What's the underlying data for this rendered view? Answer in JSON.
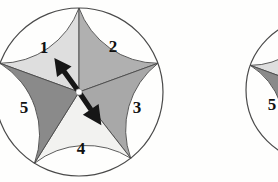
{
  "figure": {
    "background_color": "#fefefd"
  },
  "spinners": [
    {
      "name": "spinner-left",
      "center": {
        "x": 79,
        "y": 92
      },
      "radius": 84,
      "hub": {
        "color": "#ffffff",
        "radius": 3.2
      },
      "outline_color": "#4a4a4a",
      "sectors": [
        {
          "number": "1",
          "label": "1",
          "color": "#dedede",
          "start_angle": 90,
          "end_angle": 160,
          "label_x": 44,
          "label_y": 53
        },
        {
          "number": "2",
          "label": "2",
          "color": "#b0b0b0",
          "start_angle": 20,
          "end_angle": 90,
          "label_x": 113,
          "label_y": 52
        },
        {
          "number": "3",
          "label": "3",
          "color": "#a8a8a8",
          "start_angle": -52,
          "end_angle": 20,
          "label_x": 137,
          "label_y": 113
        },
        {
          "number": "4",
          "label": "4",
          "color": "#f2f2f0",
          "start_angle": -122,
          "end_angle": -52,
          "label_x": 81,
          "label_y": 154
        },
        {
          "number": "5",
          "label": "5",
          "color": "#8a8a8a",
          "start_angle": 160,
          "end_angle": 238,
          "label_x": 24,
          "label_y": 113
        }
      ],
      "pointer": {
        "color": "#161616",
        "upper_angle_deg": 126,
        "lower_angle_deg": -56,
        "upper_length": 42,
        "lower_length": 40
      }
    },
    {
      "name": "spinner-right",
      "center": {
        "x": 318,
        "y": 90
      },
      "radius": 72,
      "hub": {
        "color": "#ffffff",
        "radius": 2.8
      },
      "outline_color": "#4a4a4a",
      "sectors": [
        {
          "number": "1",
          "label": "",
          "color": "#dedede",
          "start_angle": 90,
          "end_angle": 160,
          "label_x": 0,
          "label_y": 0
        },
        {
          "number": "5",
          "label": "5",
          "color": "#8a8a8a",
          "start_angle": 160,
          "end_angle": 238,
          "label_x": 272,
          "label_y": 110
        },
        {
          "number": "4",
          "label": "",
          "color": "#f2f2f0",
          "start_angle": -122,
          "end_angle": -52,
          "label_x": 0,
          "label_y": 0
        },
        {
          "number": "3",
          "label": "",
          "color": "#a8a8a8",
          "start_angle": -52,
          "end_angle": 20,
          "label_x": 0,
          "label_y": 0
        },
        {
          "number": "2",
          "label": "",
          "color": "#b0b0b0",
          "start_angle": 20,
          "end_angle": 90,
          "label_x": 0,
          "label_y": 0
        }
      ],
      "pointer": null
    }
  ],
  "label_font_size": 17
}
